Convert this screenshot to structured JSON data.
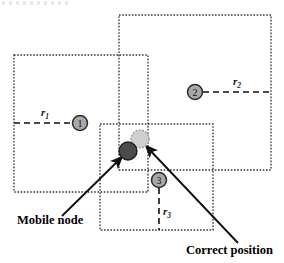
{
  "figure": {
    "width": 284,
    "height": 263,
    "background": "#ffffff"
  },
  "colors": {
    "region_border": "#3a3a3a",
    "anchor_fill": "#a8a8a8",
    "anchor_stroke": "#2b2b2b",
    "mobile_node_fill": "#4a4a4a",
    "mobile_node_stroke": "#1f1f1f",
    "correct_position_fill": "#cfcfcf",
    "correct_position_stroke": "#9a9a9a",
    "arrow_color": "#111111",
    "radius_line_color": "#111111",
    "text_color": "#000000"
  },
  "regions": [
    {
      "id": "region-1",
      "name": "anchor-1-coverage",
      "x": 14,
      "y": 55,
      "width": 134,
      "height": 137
    },
    {
      "id": "region-2",
      "name": "anchor-2-coverage",
      "x": 119,
      "y": 15,
      "width": 152,
      "height": 155
    },
    {
      "id": "region-3",
      "name": "anchor-3-coverage",
      "x": 100,
      "y": 124,
      "width": 113,
      "height": 106
    }
  ],
  "anchors": [
    {
      "id": "anchor-1",
      "label": "1",
      "cx": 80,
      "cy": 123,
      "r": 7.5,
      "radius_label": "r",
      "radius_subscript": "1",
      "line_from_x": 14,
      "line_from_y": 123,
      "line_to_x": 72,
      "line_to_y": 123,
      "label_x": 41,
      "label_y": 116
    },
    {
      "id": "anchor-2",
      "label": "2",
      "cx": 195,
      "cy": 92,
      "r": 7.5,
      "radius_label": "r",
      "radius_subscript": "2",
      "line_from_x": 203,
      "line_from_y": 92,
      "line_to_x": 271,
      "line_to_y": 92,
      "label_x": 233,
      "label_y": 85
    },
    {
      "id": "anchor-3",
      "label": "3",
      "cx": 159,
      "cy": 180,
      "r": 7.5,
      "radius_label": "r",
      "radius_subscript": "3",
      "line_from_x": 159,
      "line_from_y": 188,
      "line_to_x": 159,
      "line_to_y": 230,
      "label_x": 163,
      "label_y": 215
    }
  ],
  "nodes": {
    "mobile": {
      "name": "mobile-node",
      "cx": 128,
      "cy": 151,
      "r": 9
    },
    "correct": {
      "name": "correct-position-node",
      "cx": 140,
      "cy": 139,
      "r": 9
    }
  },
  "callouts": [
    {
      "id": "callout-mobile-node",
      "text": "Mobile node",
      "text_x": 17,
      "text_y": 224,
      "arrow_from_x": 62,
      "arrow_from_y": 216,
      "arrow_to_x": 122,
      "arrow_to_y": 157
    },
    {
      "id": "callout-correct-position",
      "text": "Correct position",
      "text_x": 186,
      "text_y": 254,
      "arrow_from_x": 238,
      "arrow_from_y": 243,
      "arrow_to_x": 146,
      "arrow_to_y": 146
    }
  ]
}
